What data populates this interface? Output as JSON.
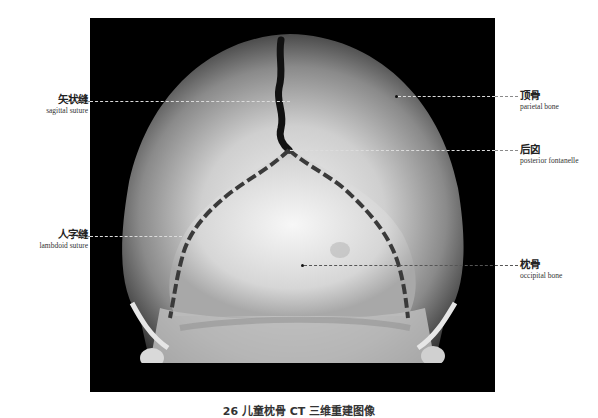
{
  "figure": {
    "caption": "26 儿童枕骨 CT 三维重建图像",
    "image_description": "3D CT reconstruction of an infant skull, posterior view"
  },
  "labels": {
    "sagittal": {
      "cn": "矢状缝",
      "en": "sagittal suture"
    },
    "lambdoid": {
      "cn": "人字缝",
      "en": "lambdoid suture"
    },
    "parietal": {
      "cn": "顶骨",
      "en": "parietal bone"
    },
    "fontanelle": {
      "cn": "后囟",
      "en": "posterior fontanelle"
    },
    "occipital": {
      "cn": "枕骨",
      "en": "occipital bone"
    }
  }
}
